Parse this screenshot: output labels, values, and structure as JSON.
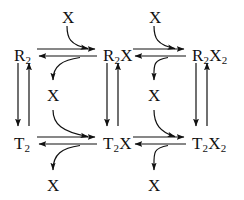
{
  "diagram": {
    "ink_color": "#111111",
    "background_color": "#ffffff",
    "species": [
      {
        "id": "R2",
        "label_main": "R",
        "label_sub": "2",
        "label_tail": "",
        "x": 14,
        "y": 47
      },
      {
        "id": "R2X",
        "label_main": "R",
        "label_sub": "2",
        "label_tail": "X",
        "x": 103,
        "y": 47
      },
      {
        "id": "R2X2",
        "label_main": "R",
        "label_sub": "2",
        "label_tail": "X",
        "label_tail_sub": "2",
        "x": 192,
        "y": 47
      },
      {
        "id": "T2",
        "label_main": "T",
        "label_sub": "2",
        "label_tail": "",
        "x": 14,
        "y": 135
      },
      {
        "id": "T2X",
        "label_main": "T",
        "label_sub": "2",
        "label_tail": "X",
        "x": 103,
        "y": 135
      },
      {
        "id": "T2X2",
        "label_main": "T",
        "label_sub": "2",
        "label_tail": "X",
        "label_tail_sub": "2",
        "x": 192,
        "y": 135
      }
    ],
    "ligands": [
      {
        "id": "x-top-left",
        "label": "X",
        "x": 65,
        "y": 9,
        "role": "substrate-in"
      },
      {
        "id": "x-top-right",
        "label": "X",
        "x": 152,
        "y": 9,
        "role": "substrate-in"
      },
      {
        "id": "x-mid-left",
        "label": "X",
        "x": 47,
        "y": 87,
        "role": "substrate-out"
      },
      {
        "id": "x-mid-right",
        "label": "X",
        "x": 148,
        "y": 87,
        "role": "substrate-out"
      },
      {
        "id": "x-bottom-left",
        "label": "X",
        "x": 47,
        "y": 177,
        "role": "substrate-out"
      },
      {
        "id": "x-bottom-right",
        "label": "X",
        "x": 148,
        "y": 177,
        "role": "substrate-out"
      }
    ],
    "reactions": [
      {
        "id": "R2-to-R2X",
        "from": "R2",
        "to": "R2X",
        "direction": "reversible",
        "orientation": "horizontal"
      },
      {
        "id": "R2X-to-R2X2",
        "from": "R2X",
        "to": "R2X2",
        "direction": "reversible",
        "orientation": "horizontal"
      },
      {
        "id": "T2-to-T2X",
        "from": "T2",
        "to": "T2X",
        "direction": "reversible",
        "orientation": "horizontal"
      },
      {
        "id": "T2X-to-T2X2",
        "from": "T2X",
        "to": "T2X2",
        "direction": "reversible",
        "orientation": "horizontal"
      },
      {
        "id": "R2-to-T2",
        "from": "R2",
        "to": "T2",
        "direction": "reversible",
        "orientation": "vertical"
      },
      {
        "id": "R2X-to-T2X",
        "from": "R2X",
        "to": "T2X",
        "direction": "reversible",
        "orientation": "vertical"
      },
      {
        "id": "R2X2-to-T2X2",
        "from": "R2X2",
        "to": "T2X2",
        "direction": "reversible",
        "orientation": "vertical"
      }
    ]
  }
}
